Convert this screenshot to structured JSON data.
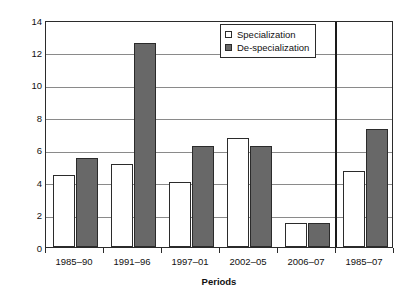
{
  "chart_data": {
    "type": "bar",
    "title": "",
    "subtitle": "",
    "xlabel": "Periods",
    "ylabel": "Net changes per year",
    "categories": [
      "1985–90",
      "1991–96",
      "1997–01",
      "2002–05",
      "2006–07",
      "1985–07"
    ],
    "series": [
      {
        "name": "Specialization",
        "color": "#ffffff",
        "edge_color": "#2b2b2b",
        "swatch": "open-square",
        "values": [
          4.45,
          5.15,
          4.0,
          6.75,
          1.5,
          4.7
        ]
      },
      {
        "name": "De-specialization",
        "color": "#686868",
        "edge_color": "#2b2b2b",
        "swatch": "filled-square",
        "values": [
          5.5,
          12.6,
          6.2,
          6.25,
          1.5,
          7.3
        ]
      }
    ],
    "ylim": [
      0,
      14
    ],
    "yticks": [
      0,
      2,
      4,
      6,
      8,
      10,
      12,
      14
    ],
    "ytick_labels": [
      "0",
      "2",
      "4",
      "6",
      "8",
      "10",
      "12",
      "14"
    ],
    "grid": "horizontal",
    "legend_position": "top-center-right",
    "annotations": [
      {
        "type": "vertical-separator",
        "after_category": "2006–07",
        "description": "thick vertical rule separating the five sub-periods from the overall 1985–07 column"
      }
    ]
  },
  "legend": {
    "entries": [
      {
        "label": "Specialization"
      },
      {
        "label": "De-specialization"
      }
    ]
  }
}
